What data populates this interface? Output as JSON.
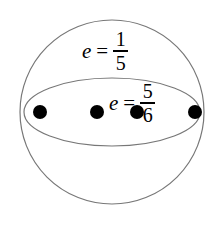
{
  "figure": {
    "type": "geometry-diagram",
    "background_color": "#ffffff",
    "stroke_color": "#777777",
    "point_color": "#000000",
    "text_color": "#000000",
    "sphere": {
      "name": "outer-circle",
      "center_x": 112,
      "center_y": 112,
      "radius": 92,
      "stroke_width": 1.2
    },
    "equator": {
      "name": "equator-ellipse",
      "center_x": 112,
      "center_y": 112,
      "radius_x": 88,
      "radius_y": 34,
      "stroke_width": 1.2
    },
    "points": [
      {
        "name": "point-1",
        "x": 40,
        "y": 112,
        "r": 7
      },
      {
        "name": "point-2",
        "x": 97,
        "y": 112,
        "r": 7
      },
      {
        "name": "point-3",
        "x": 137,
        "y": 112,
        "r": 7
      },
      {
        "name": "point-4",
        "x": 195,
        "y": 112,
        "r": 7
      }
    ],
    "labels": [
      {
        "name": "upper-hemisphere-label",
        "variable": "e",
        "relation": "=",
        "numerator": "1",
        "denominator": "5",
        "text": "e = 1/5"
      },
      {
        "name": "equator-label",
        "variable": "e",
        "relation": "=",
        "numerator": "5",
        "denominator": "6",
        "text": "e = 5/6"
      }
    ]
  }
}
